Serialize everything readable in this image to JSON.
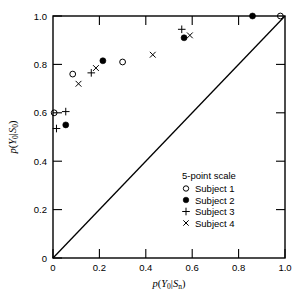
{
  "chart_data": {
    "type": "scatter",
    "title": "",
    "xlabel": "p(Y0|Sn)",
    "ylabel": "p(Y0|S0)",
    "xlim": [
      0,
      1.0
    ],
    "ylim": [
      0,
      1.0
    ],
    "grid": false,
    "legend_position": "lower-right",
    "legend_title": "5-point scale",
    "xticks": [
      0,
      0.2,
      0.4,
      0.6,
      0.8,
      1.0
    ],
    "xticklabels": [
      "0",
      "0.2",
      "0.4",
      "0.6",
      "0.8",
      "1.0"
    ],
    "yticks": [
      0,
      0.2,
      0.4,
      0.6,
      0.8,
      1.0
    ],
    "yticklabels": [
      "0",
      "0.2",
      "0.4",
      "0.6",
      "0.8",
      "1.0"
    ],
    "annotations": [
      "diagonal chance line from (0,0) to (1.0,1.0)"
    ],
    "series": [
      {
        "name": "Subject 1",
        "marker": "open-circle",
        "points": [
          {
            "x": 0.005,
            "y": 0.6
          },
          {
            "x": 0.085,
            "y": 0.76
          },
          {
            "x": 0.3,
            "y": 0.81
          },
          {
            "x": 0.98,
            "y": 1.0
          }
        ]
      },
      {
        "name": "Subject 2",
        "marker": "filled-circle",
        "points": [
          {
            "x": 0.055,
            "y": 0.55
          },
          {
            "x": 0.215,
            "y": 0.815
          },
          {
            "x": 0.565,
            "y": 0.91
          },
          {
            "x": 0.86,
            "y": 1.0
          }
        ]
      },
      {
        "name": "Subject 3",
        "marker": "plus",
        "points": [
          {
            "x": 0.015,
            "y": 0.535
          },
          {
            "x": 0.055,
            "y": 0.605
          },
          {
            "x": 0.165,
            "y": 0.765
          },
          {
            "x": 0.555,
            "y": 0.945
          }
        ]
      },
      {
        "name": "Subject 4",
        "marker": "cross",
        "points": [
          {
            "x": 0.11,
            "y": 0.72
          },
          {
            "x": 0.185,
            "y": 0.785
          },
          {
            "x": 0.43,
            "y": 0.84
          },
          {
            "x": 0.59,
            "y": 0.92
          }
        ]
      }
    ]
  },
  "legend": {
    "title": "5-point scale",
    "entries": [
      {
        "label": "Subject 1",
        "marker": "open-circle"
      },
      {
        "label": "Subject 2",
        "marker": "filled-circle"
      },
      {
        "label": "Subject 3",
        "marker": "plus"
      },
      {
        "label": "Subject 4",
        "marker": "cross"
      }
    ]
  },
  "axes": {
    "x_title_parts": {
      "p": "p",
      "open": "(",
      "Y": "Y",
      "Ysub": "0",
      "bar": "|",
      "S": "S",
      "Ssub": "n",
      "close": ")"
    },
    "y_title_parts": {
      "p": "p",
      "open": "(",
      "Y": "Y",
      "Ysub": "0",
      "bar": "|",
      "S": "S",
      "Ssub": "0",
      "close": ")"
    }
  }
}
